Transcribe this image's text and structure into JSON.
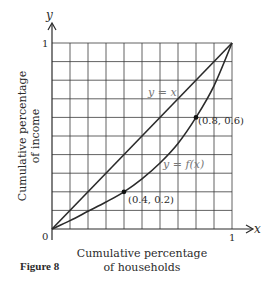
{
  "figure": {
    "caption": "Figure 8",
    "x_axis_letter": "x",
    "y_axis_letter": "y",
    "x_label_line1": "Cumulative percentage",
    "x_label_line2": "of households",
    "y_label_line1": "Cumulative percentage",
    "y_label_line2": "of income",
    "origin_label": "0",
    "x_tick_one": "1",
    "y_tick_one": "1",
    "line_label": "y = x",
    "curve_label": "y = f(x)",
    "point1_label": "(0.4, 0.2)",
    "point2_label": "(0.8, 0.6)"
  },
  "chart_data": {
    "type": "line",
    "title": "Figure 8",
    "xlabel": "Cumulative percentage of households",
    "ylabel": "Cumulative percentage of income",
    "xlim": [
      0,
      1
    ],
    "ylim": [
      0,
      1
    ],
    "x_ticks": [
      "0",
      "1"
    ],
    "y_ticks": [
      "1"
    ],
    "grid": true,
    "grid_divisions": 10,
    "series": [
      {
        "name": "y = x",
        "x": [
          0,
          1
        ],
        "y": [
          0,
          1
        ]
      },
      {
        "name": "y = f(x)",
        "x": [
          0,
          0.1,
          0.2,
          0.3,
          0.4,
          0.5,
          0.6,
          0.7,
          0.8,
          0.9,
          1.0
        ],
        "y": [
          0,
          0.045,
          0.095,
          0.145,
          0.2,
          0.27,
          0.355,
          0.46,
          0.6,
          0.77,
          1.0
        ]
      }
    ],
    "marked_points": [
      {
        "x": 0.4,
        "y": 0.2,
        "label": "(0.4, 0.2)"
      },
      {
        "x": 0.8,
        "y": 0.6,
        "label": "(0.8, 0.6)"
      }
    ],
    "annotations": [
      "y = x",
      "y = f(x)"
    ],
    "colors": {
      "ink": "#2b2b2b",
      "grid": "#3a3a3a",
      "label": "#777777"
    }
  }
}
